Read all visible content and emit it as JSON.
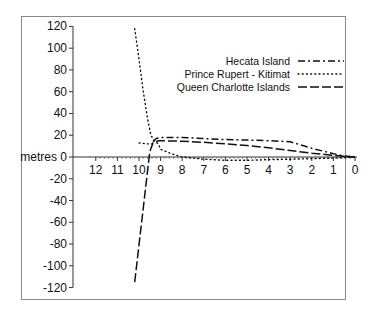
{
  "chart_data": {
    "type": "line",
    "title": "",
    "xlabel": "",
    "ylabel": "metres",
    "xlim": [
      12.5,
      0
    ],
    "ylim": [
      -120,
      120
    ],
    "x_ticks": [
      12,
      11,
      10,
      9,
      8,
      7,
      6,
      5,
      4,
      3,
      2,
      1,
      0
    ],
    "y_ticks": [
      120,
      100,
      80,
      60,
      40,
      20,
      0,
      -20,
      -40,
      -60,
      -80,
      -100,
      -120
    ],
    "y_tick_labels": [
      "120",
      "100",
      "80",
      "60",
      "40",
      "20",
      "metres 0",
      "-20",
      "-40",
      "-60",
      "-80",
      "-100",
      "-120"
    ],
    "x_axis_reversed": true,
    "grid": false,
    "legend_position": "upper right",
    "series": [
      {
        "name": "Hecata Island",
        "style": "dash-dot",
        "points": [
          [
            9.35,
            14
          ],
          [
            9.2,
            17
          ],
          [
            9.0,
            18
          ],
          [
            8,
            18
          ],
          [
            7,
            17
          ],
          [
            6,
            16
          ],
          [
            5,
            15.5
          ],
          [
            4,
            15
          ],
          [
            3,
            14
          ],
          [
            2.5,
            11
          ],
          [
            2,
            8
          ],
          [
            1,
            3
          ],
          [
            0.5,
            1
          ],
          [
            0,
            0
          ]
        ]
      },
      {
        "name": "Prince Rupert - Kitimat",
        "style": "dotted",
        "points": [
          [
            10.2,
            118
          ],
          [
            10.0,
            90
          ],
          [
            9.8,
            60
          ],
          [
            9.6,
            35
          ],
          [
            9.45,
            20
          ],
          [
            9.3,
            15
          ],
          [
            9.1,
            12
          ],
          [
            9.0,
            7
          ],
          [
            8.5,
            3
          ],
          [
            8,
            0
          ],
          [
            7,
            -2
          ],
          [
            6,
            -3
          ],
          [
            5,
            -3
          ],
          [
            4,
            -2.5
          ],
          [
            3,
            -2
          ],
          [
            2,
            -1.5
          ],
          [
            1,
            -1
          ],
          [
            0,
            0
          ]
        ],
        "branch_points": [
          [
            10.0,
            13
          ],
          [
            9.6,
            12
          ],
          [
            9.3,
            12
          ]
        ]
      },
      {
        "name": "Queen Charlotte Islands",
        "style": "long-dash",
        "points": [
          [
            10.2,
            -115
          ],
          [
            9.5,
            5
          ],
          [
            9.35,
            13
          ],
          [
            9.1,
            15
          ],
          [
            8,
            14.5
          ],
          [
            7,
            13.5
          ],
          [
            6,
            12
          ],
          [
            5,
            10.5
          ],
          [
            4,
            8.5
          ],
          [
            3,
            6
          ],
          [
            2,
            3.5
          ],
          [
            1,
            1.5
          ],
          [
            0,
            0
          ]
        ]
      }
    ]
  },
  "legend": {
    "items": [
      {
        "label": "Hecata Island",
        "style": "dash-dot"
      },
      {
        "label": "Prince Rupert - Kitimat",
        "style": "dotted"
      },
      {
        "label": "Queen Charlotte Islands",
        "style": "long-dash"
      }
    ]
  }
}
